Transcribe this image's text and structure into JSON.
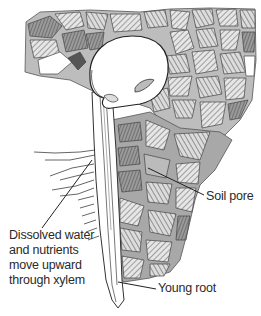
{
  "figure": {
    "labels": {
      "soil_pore": "Soil pore",
      "xylem_line1": "Dissolved water",
      "xylem_line2": "and nutrients",
      "xylem_line3": "move upward",
      "xylem_line4": "through xylem",
      "young_root": "Young root"
    },
    "colors": {
      "background": "#ffffff",
      "ink": "#2a2a2a",
      "soil_particle_dark": "#8a8a8a",
      "soil_particle_light": "#c8c8c8",
      "seed_fill": "#ffffff"
    }
  }
}
